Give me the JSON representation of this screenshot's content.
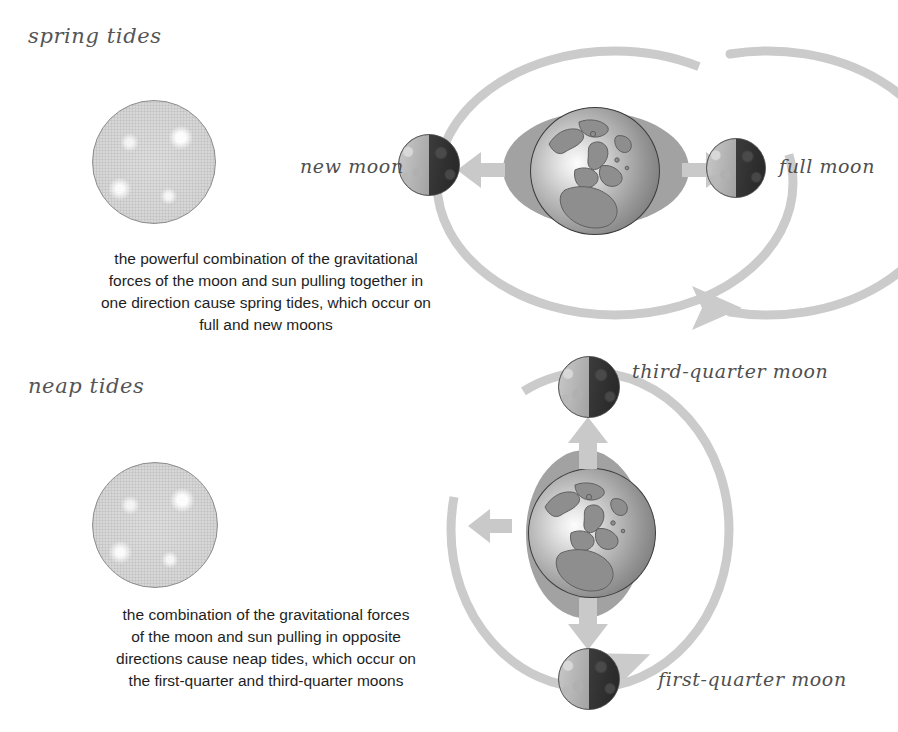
{
  "figure": {
    "accent_gray": "#c9c9c9",
    "arrow_gray": "#c4c4c4",
    "bulge_gray": "#9a9a9a"
  },
  "sections": [
    {
      "id": "spring",
      "title": "spring tides",
      "caption": "the powerful combination of the gravitational\nforces of the moon and sun pulling together in\none direction cause spring tides, which occur on\nfull and new moons",
      "sun_label": "sun",
      "earth_label": "earth",
      "moons": [
        {
          "id": "new-moon",
          "label": "new moon",
          "phase": "lit-left-dark-right"
        },
        {
          "id": "full-moon",
          "label": "full moon",
          "phase": "lit-left-dark-right"
        }
      ],
      "bulge_orientation": "horizontal",
      "arrows": [
        "left",
        "right"
      ],
      "orbit_shape": "ellipse",
      "orbit_direction": "clockwise"
    },
    {
      "id": "neap",
      "title": "neap tides",
      "caption": "the combination of the gravitational forces\nof the moon and sun pulling in opposite\ndirections cause neap tides, which occur on\nthe first-quarter and third-quarter moons",
      "sun_label": "sun",
      "earth_label": "earth",
      "moons": [
        {
          "id": "third-quarter-moon",
          "label": "third-quarter moon",
          "phase": "lit-left-dark-right"
        },
        {
          "id": "first-quarter-moon",
          "label": "first-quarter moon",
          "phase": "lit-left-dark-right"
        }
      ],
      "bulge_orientation": "vertical",
      "arrows": [
        "up",
        "down",
        "left"
      ],
      "orbit_shape": "circle",
      "orbit_direction": "clockwise"
    }
  ]
}
